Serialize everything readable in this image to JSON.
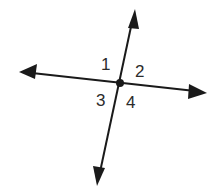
{
  "diagram": {
    "angle_labels": [
      "1",
      "2",
      "3",
      "4"
    ],
    "line_color": "#1a1a1a",
    "label_color": "#2b2b2b"
  }
}
